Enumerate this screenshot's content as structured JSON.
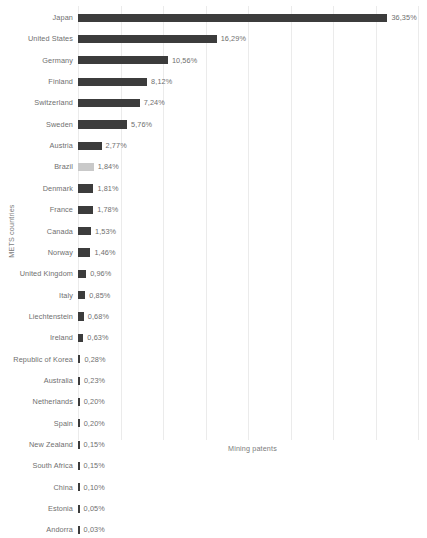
{
  "chart_data": {
    "type": "bar",
    "orientation": "horizontal",
    "title": "",
    "xlabel": "Mining patents",
    "ylabel": "METS countries",
    "xlim": [
      0,
      41
    ],
    "grid": "vertical",
    "gridline_step": 5,
    "legend": "none",
    "value_suffix": "%",
    "decimal_separator": ",",
    "colors": {
      "bar": "#3c3c3c",
      "bar_highlight": "#c9c9c9",
      "gridline": "#ebebeb",
      "text": "#6f6f6f",
      "background": "#ffffff"
    },
    "categories": [
      "Japan",
      "United States",
      "Germany",
      "Finland",
      "Switzerland",
      "Sweden",
      "Austria",
      "Brazil",
      "Denmark",
      "France",
      "Canada",
      "Norway",
      "United Kingdom",
      "Italy",
      "Liechtenstein",
      "Ireland",
      "Republic of Korea",
      "Australia",
      "Netherlands",
      "Spain",
      "New Zealand",
      "South Africa",
      "China",
      "Estonia",
      "Andorra"
    ],
    "values": [
      36.35,
      16.29,
      10.56,
      8.12,
      7.24,
      5.76,
      2.77,
      1.84,
      1.81,
      1.78,
      1.53,
      1.46,
      0.96,
      0.85,
      0.68,
      0.63,
      0.28,
      0.23,
      0.2,
      0.2,
      0.15,
      0.15,
      0.1,
      0.05,
      0.03
    ],
    "value_labels": [
      "36,35%",
      "16,29%",
      "10,56%",
      "8,12%",
      "7,24%",
      "5,76%",
      "2,77%",
      "1,84%",
      "1,81%",
      "1,78%",
      "1,53%",
      "1,46%",
      "0,96%",
      "0,85%",
      "0,68%",
      "0,63%",
      "0,28%",
      "0,23%",
      "0,20%",
      "0,20%",
      "0,15%",
      "0,15%",
      "0,10%",
      "0,05%",
      "0,03%"
    ],
    "highlighted_categories": [
      "Brazil"
    ]
  }
}
